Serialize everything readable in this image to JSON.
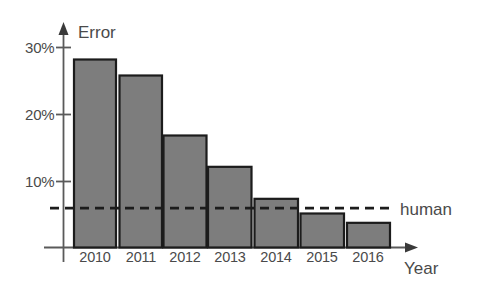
{
  "chart_data": {
    "type": "bar",
    "title": "",
    "series_label": "Error",
    "xlabel": "Year",
    "ylabel": "Error",
    "categories": [
      "2010",
      "2011",
      "2012",
      "2013",
      "2014",
      "2015",
      "2016"
    ],
    "values": [
      28.2,
      25.8,
      16.8,
      12.1,
      7.3,
      5.1,
      3.7
    ],
    "value_suffix": "%",
    "ytick_labels": [
      "10%",
      "20%",
      "30%"
    ],
    "ytick_values": [
      10,
      20,
      30
    ],
    "ylim": [
      0,
      31
    ],
    "grid": false,
    "legend_position": "none",
    "annotations": [
      {
        "name": "human-baseline",
        "label": "human",
        "value": 5.9,
        "style": "dashed-horizontal-line"
      }
    ],
    "colors": {
      "bar_fill": "#7d7d7d",
      "bar_stroke": "#1c1c1c",
      "axis": "#5a5a5a",
      "text": "#4a4a4a",
      "annotation_line": "#1c1c1c",
      "background": "#ffffff"
    }
  },
  "labels": {
    "y_axis_title": "Error",
    "x_axis_title": "Year",
    "human_annotation": "human",
    "ytick_30": "30%",
    "ytick_20": "20%",
    "ytick_10": "10%",
    "year_2010": "2010",
    "year_2011": "2011",
    "year_2012": "2012",
    "year_2013": "2013",
    "year_2014": "2014",
    "year_2015": "2015",
    "year_2016": "2016"
  }
}
